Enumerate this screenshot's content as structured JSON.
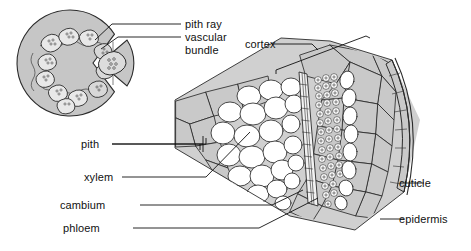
{
  "figure": {
    "type": "botanical-anatomy-diagram"
  },
  "colors": {
    "background": "#ffffff",
    "ground_tissue_gray": "#d0d0d0",
    "cortex_cell_gray": "#c9c9c9",
    "inset_disc_gray": "#c6c6c6",
    "bundle_fill": "#b9b9b9",
    "cell_white": "#ffffff",
    "stroke": "#2b2b2b",
    "label_text": "#111111"
  },
  "labels": {
    "pith_ray": "pith ray",
    "vascular_bundle_line1": "vascular",
    "vascular_bundle_line2": "bundle",
    "cortex": "cortex",
    "pith": "pith",
    "xylem": "xylem",
    "cambium": "cambium",
    "phloem": "phloem",
    "cuticle": "cuticle",
    "epidermis": "epidermis"
  },
  "inset": {
    "name": "whole stem cross-section",
    "bundle_count": 11,
    "description": "circular stem outline with ring of vascular bundles and a removed wedge segment shown enlarged beside it"
  },
  "wedge": {
    "name": "enlarged pie-slice sector",
    "tissue_order_inside_out": [
      "pith",
      "xylem",
      "cambium",
      "phloem",
      "cortex",
      "epidermis",
      "cuticle"
    ]
  }
}
